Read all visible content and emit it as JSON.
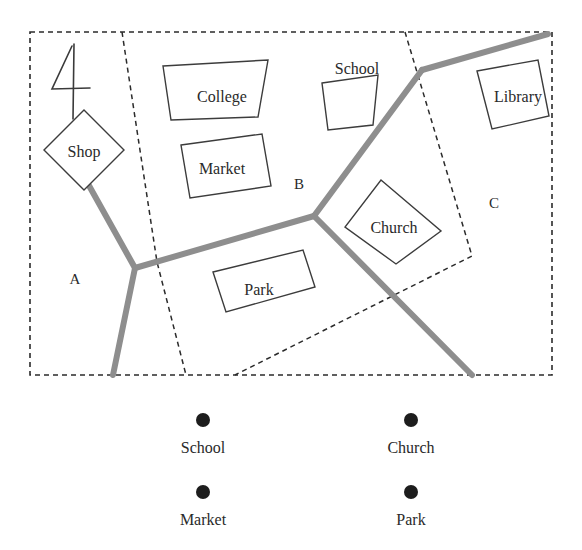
{
  "figure": {
    "index_numeral": "4",
    "zones": [
      {
        "id": "A",
        "label": "A",
        "x": 75,
        "y": 281
      },
      {
        "id": "B",
        "label": "B",
        "x": 299,
        "y": 186
      },
      {
        "id": "C",
        "label": "C",
        "x": 494,
        "y": 205
      }
    ],
    "buildings": [
      {
        "id": "shop",
        "label": "Shop",
        "label_x": 84,
        "label_y": 153,
        "shape": "diamond",
        "points": "84,110 124,150 84,190 44,150"
      },
      {
        "id": "college",
        "label": "College",
        "label_x": 222,
        "label_y": 98,
        "shape": "trapezoid",
        "points": "163,66 268,60 258,117 171,120"
      },
      {
        "id": "market",
        "label": "Market",
        "label_x": 222,
        "label_y": 170,
        "shape": "rectangle",
        "points": "181,145 262,134 271,186 190,198"
      },
      {
        "id": "school",
        "label": "School",
        "label_x": 357,
        "label_y": 70,
        "shape": "quad",
        "points": "322,83 378,75 373,125 328,130"
      },
      {
        "id": "library",
        "label": "Library",
        "label_x": 518,
        "label_y": 98,
        "shape": "quad",
        "points": "477,71 538,60 549,116 492,129"
      },
      {
        "id": "church",
        "label": "Church",
        "label_x": 394,
        "label_y": 229,
        "shape": "diamond",
        "points": "381,180 441,231 396,264 345,227"
      },
      {
        "id": "park",
        "label": "Park",
        "label_x": 259,
        "label_y": 291,
        "shape": "rectangle",
        "points": "213,272 303,250 315,287 226,312"
      }
    ],
    "roads": [
      {
        "id": "road-shop-sw",
        "path": "M 63,139 L 135,268"
      },
      {
        "id": "road-junction-sw",
        "path": "M 135,268 L 113,375"
      },
      {
        "id": "road-junction-ne",
        "path": "M 135,268 L 314,216"
      },
      {
        "id": "road-mid-to-bend",
        "path": "M 314,216 L 422,70"
      },
      {
        "id": "road-bend-to-edge",
        "path": "M 422,70 L 548,34"
      },
      {
        "id": "road-mid-se",
        "path": "M 314,216 L 472,375"
      }
    ],
    "zone_outline": "M 30,32 L 552,32 L 552,375 L 30,375 Z",
    "zone_dividers": [
      {
        "id": "divider-a-b",
        "path": "M 122,32 L 157,262 L 186,375"
      },
      {
        "id": "divider-b-c",
        "path": "M 405,32 L 472,256 L 235,375"
      }
    ]
  },
  "legend": {
    "items": [
      {
        "id": "school",
        "label": "School",
        "dot_x": 203,
        "dot_y": 420,
        "label_x": 203,
        "label_y": 449
      },
      {
        "id": "church",
        "label": "Church",
        "dot_x": 411,
        "dot_y": 420,
        "label_x": 411,
        "label_y": 449
      },
      {
        "id": "market",
        "label": "Market",
        "dot_x": 203,
        "dot_y": 492,
        "label_x": 203,
        "label_y": 521
      },
      {
        "id": "park",
        "label": "Park",
        "dot_x": 411,
        "dot_y": 492,
        "label_x": 411,
        "label_y": 521
      }
    ],
    "dot_radius": 7
  },
  "colors": {
    "road": "#8e8e8e",
    "outline": "#2b2b2b",
    "building_stroke": "#3c3c3c",
    "text": "#2a2a2a",
    "dot": "#1d1d1d",
    "background": "#ffffff"
  }
}
